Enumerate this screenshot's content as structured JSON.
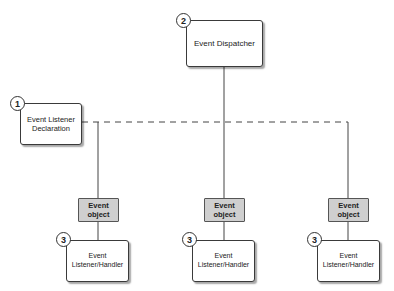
{
  "diagram": {
    "dispatcher": {
      "step": "2",
      "label": "Event Dispatcher"
    },
    "declaration": {
      "step": "1",
      "label_line1": "Event Listener",
      "label_line2": "Declaration"
    },
    "branches": [
      {
        "event_object_line1": "Event",
        "event_object_line2": "object",
        "step": "3",
        "listener_line1": "Event",
        "listener_line2": "Listener/Handler"
      },
      {
        "event_object_line1": "Event",
        "event_object_line2": "object",
        "step": "3",
        "listener_line1": "Event",
        "listener_line2": "Listener/Handler"
      },
      {
        "event_object_line1": "Event",
        "event_object_line2": "object",
        "step": "3",
        "listener_line1": "Event",
        "listener_line2": "Listener/Handler"
      }
    ],
    "colors": {
      "event_object_fill": "#cfcfcf",
      "line": "#444444",
      "box_border": "#3a3a3a"
    }
  }
}
